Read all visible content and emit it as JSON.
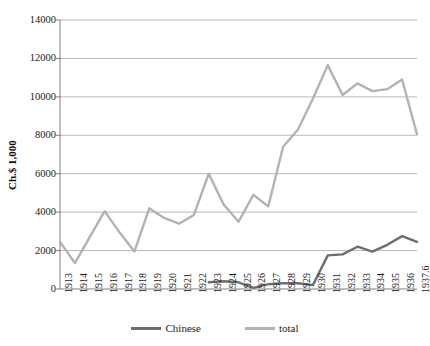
{
  "chart_data": {
    "type": "line",
    "title": "",
    "xlabel": "",
    "ylabel": "Ch.$ 1,000",
    "ylim": [
      0,
      14000
    ],
    "ytick_step": 2000,
    "yticks": [
      "0",
      "2000",
      "4000",
      "6000",
      "8000",
      "10000",
      "12000",
      "14000"
    ],
    "grid": true,
    "legend_position": "bottom",
    "categories": [
      "1913",
      "1914",
      "1915",
      "1916",
      "1917",
      "1918",
      "1919",
      "1920",
      "1921",
      "1922",
      "1923",
      "1924",
      "1925",
      "1926",
      "1927",
      "1928",
      "1929",
      "1930",
      "1931",
      "1932",
      "1933",
      "1934",
      "1935",
      "1936",
      "1937.6"
    ],
    "series": [
      {
        "name": "Chinese",
        "color": "#6e6e6e",
        "values": [
          null,
          null,
          null,
          null,
          null,
          null,
          null,
          null,
          null,
          null,
          350,
          400,
          350,
          60,
          250,
          300,
          300,
          200,
          1750,
          1800,
          2200,
          1950,
          2300,
          2750,
          2450
        ]
      },
      {
        "name": "total",
        "color": "#b3b3b3",
        "values": [
          2450,
          1350,
          2700,
          4050,
          2950,
          1950,
          4200,
          3700,
          3400,
          3850,
          6000,
          4400,
          3500,
          4900,
          4300,
          7400,
          8300,
          9900,
          11650,
          10100,
          10700,
          10300,
          10400,
          10900,
          8050
        ]
      }
    ]
  },
  "legend": {
    "items": [
      {
        "label": "Chinese",
        "color": "#6e6e6e"
      },
      {
        "label": "total",
        "color": "#b3b3b3"
      }
    ]
  },
  "axes": {
    "y_axis_title": "Ch.$ 1,000"
  }
}
